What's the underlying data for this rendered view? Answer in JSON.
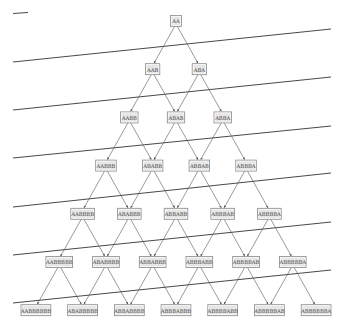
{
  "diagram": {
    "title": "",
    "rows": [
      [
        "AA"
      ],
      [
        "AAB",
        "ABA"
      ],
      [
        "AABB",
        "ABAB",
        "ABBA"
      ],
      [
        "AABBB",
        "ABABB",
        "ABBAB",
        "ABBBA"
      ],
      [
        "AABBBB",
        "ABABBB",
        "ABBABB",
        "ABBBAB",
        "ABBBBA"
      ],
      [
        "AABBBBB",
        "ABABBBB",
        "ABBABBB",
        "ABBBABB",
        "ABBBBAB",
        "ABBBBBA"
      ],
      [
        "AABBBBBB",
        "ABABBBBB",
        "ABBABBBB",
        "ABBBABBB",
        "ABBBBABB",
        "ABBBBBAB",
        "ABBBBBBA"
      ]
    ],
    "layout": {
      "root_x": 176,
      "root_y": 21,
      "dx": 23.35,
      "dy": 48.2,
      "char_width": 3.1,
      "box_height": 11
    },
    "separator_lines": [
      {
        "x1": 13,
        "y1": 13.5,
        "x2": 28,
        "y2": 12.5
      },
      {
        "x1": 13,
        "y1": 62,
        "x2": 331,
        "y2": 29
      },
      {
        "x1": 13,
        "y1": 110,
        "x2": 331,
        "y2": 77
      },
      {
        "x1": 13,
        "y1": 158,
        "x2": 331,
        "y2": 126
      },
      {
        "x1": 13,
        "y1": 207,
        "x2": 331,
        "y2": 173
      },
      {
        "x1": 13,
        "y1": 255,
        "x2": 331,
        "y2": 222
      },
      {
        "x1": 13,
        "y1": 303,
        "x2": 331,
        "y2": 270
      }
    ],
    "colors": {
      "box_fill": "#e6e6e6",
      "box_stroke": "#8a8a8a",
      "edge": "#555555",
      "separator": "#333333",
      "text": "#444444"
    }
  }
}
